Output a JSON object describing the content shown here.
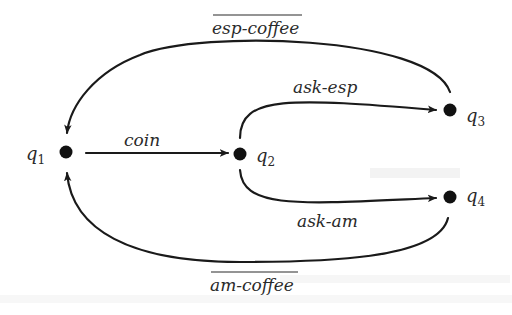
{
  "diagram": {
    "type": "state-transition-graph",
    "states": [
      {
        "id": "q1",
        "label": "q",
        "subscript": "1"
      },
      {
        "id": "q2",
        "label": "q",
        "subscript": "2"
      },
      {
        "id": "q3",
        "label": "q",
        "subscript": "3"
      },
      {
        "id": "q4",
        "label": "q",
        "subscript": "4"
      }
    ],
    "transitions": [
      {
        "from": "q1",
        "to": "q2",
        "label": "coin",
        "overlined": false
      },
      {
        "from": "q2",
        "to": "q3",
        "label": "ask-esp",
        "overlined": false
      },
      {
        "from": "q2",
        "to": "q4",
        "label": "ask-am",
        "overlined": false
      },
      {
        "from": "q3",
        "to": "q1",
        "label": "esp-coffee",
        "overlined": true
      },
      {
        "from": "q4",
        "to": "q1",
        "label": "am-coffee",
        "overlined": true
      }
    ],
    "colors": {
      "stroke": "#1a1a1a",
      "node": "#111111",
      "text": "#2a2a2a",
      "background": "#ffffff"
    }
  }
}
